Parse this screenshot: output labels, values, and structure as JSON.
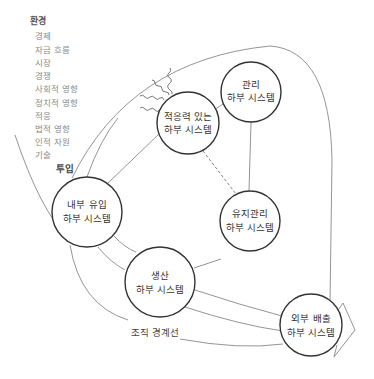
{
  "environment": {
    "title": "환경",
    "items": [
      "경제",
      "자금 흐름",
      "시장",
      "경쟁",
      "사회적 영향",
      "정치적 영향",
      "적응",
      "법적 영향",
      "인적 자원",
      "기술"
    ]
  },
  "labels": {
    "input": "투입",
    "boundary": "조직 경계선"
  },
  "nodes": {
    "management": {
      "line1": "관리",
      "line2": "하부 시스템"
    },
    "adaptive": {
      "line1": "적응력 있는",
      "line2": "하부 시스템"
    },
    "boundary_spanning_in": {
      "line1": "내부 유입",
      "line2": "하부 시스템"
    },
    "maintenance": {
      "line1": "유지관리",
      "line2": "하부 시스템"
    },
    "production": {
      "line1": "생산",
      "line2": "하부 시스템"
    },
    "boundary_spanning_out": {
      "line1": "외부 배출",
      "line2": "하부 시스템"
    }
  },
  "colors": {
    "circle_stroke": "#333333",
    "connector": "#888888",
    "env_text": "#8a8a8a"
  }
}
